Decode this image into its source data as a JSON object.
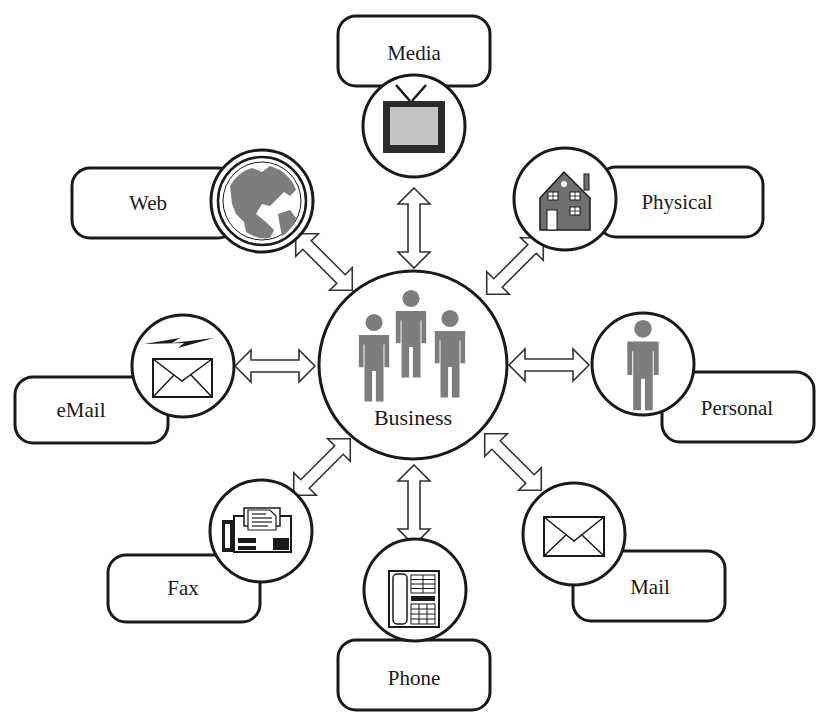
{
  "diagram": {
    "type": "hub-and-spoke",
    "center": {
      "id": "business",
      "label": "Business",
      "icon": "group-of-people-icon"
    },
    "nodes": [
      {
        "id": "media",
        "label": "Media",
        "icon": "television-icon"
      },
      {
        "id": "physical",
        "label": "Physical",
        "icon": "house-icon"
      },
      {
        "id": "personal",
        "label": "Personal",
        "icon": "person-icon"
      },
      {
        "id": "mail",
        "label": "Mail",
        "icon": "envelope-icon"
      },
      {
        "id": "phone",
        "label": "Phone",
        "icon": "desk-phone-icon"
      },
      {
        "id": "fax",
        "label": "Fax",
        "icon": "fax-machine-icon"
      },
      {
        "id": "email",
        "label": "eMail",
        "icon": "email-lightning-envelope-icon"
      },
      {
        "id": "web",
        "label": "Web",
        "icon": "globe-icon"
      }
    ],
    "edges": [
      {
        "from": "business",
        "to": "media",
        "style": "double-headed-hollow-arrow"
      },
      {
        "from": "business",
        "to": "physical",
        "style": "double-headed-hollow-arrow"
      },
      {
        "from": "business",
        "to": "personal",
        "style": "double-headed-hollow-arrow"
      },
      {
        "from": "business",
        "to": "mail",
        "style": "double-headed-hollow-arrow"
      },
      {
        "from": "business",
        "to": "phone",
        "style": "double-headed-hollow-arrow"
      },
      {
        "from": "business",
        "to": "fax",
        "style": "double-headed-hollow-arrow"
      },
      {
        "from": "business",
        "to": "email",
        "style": "double-headed-hollow-arrow"
      },
      {
        "from": "business",
        "to": "web",
        "style": "double-headed-hollow-arrow"
      }
    ],
    "colors": {
      "stroke": "#1a1a1a",
      "icon_fill": "#7a7a7a",
      "background": "#ffffff"
    }
  }
}
